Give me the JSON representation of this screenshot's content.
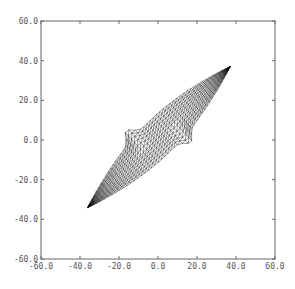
{
  "chart_data": {
    "type": "wireframe-mesh",
    "title": "",
    "xlabel": "",
    "ylabel": "",
    "xlim": [
      -60,
      60
    ],
    "ylim": [
      -60,
      60
    ],
    "grid": false,
    "legend": null,
    "x_ticks": [
      "-60.0",
      "-40.0",
      "-20.0",
      "0.0",
      "20.0",
      "40.0",
      "60.0"
    ],
    "y_ticks": [
      "60.0",
      "40.0",
      "20.0",
      "0.0",
      "-20.0",
      "-40.0",
      "-60.0"
    ],
    "x_tick_values": [
      -60,
      -40,
      -20,
      0,
      20,
      40,
      60
    ],
    "y_tick_values": [
      60,
      40,
      20,
      0,
      -20,
      -40,
      -60
    ],
    "shape": {
      "description": "Deformed quadrilateral mesh elongated along the diagonal, with two short spikes near the center",
      "outline_points": [
        {
          "name": "lower-left-tip",
          "x": -36,
          "y": -34
        },
        {
          "name": "upper-spike-tip",
          "x": -9,
          "y": 12
        },
        {
          "name": "upper-right-tip",
          "x": 37,
          "y": 37
        },
        {
          "name": "lower-spike-tip",
          "x": 9,
          "y": -9
        }
      ],
      "mesh_color": "#000000"
    }
  },
  "colors": {
    "frame": "#666666",
    "mesh": "#000000",
    "labels": "#555555",
    "background": "#ffffff"
  }
}
